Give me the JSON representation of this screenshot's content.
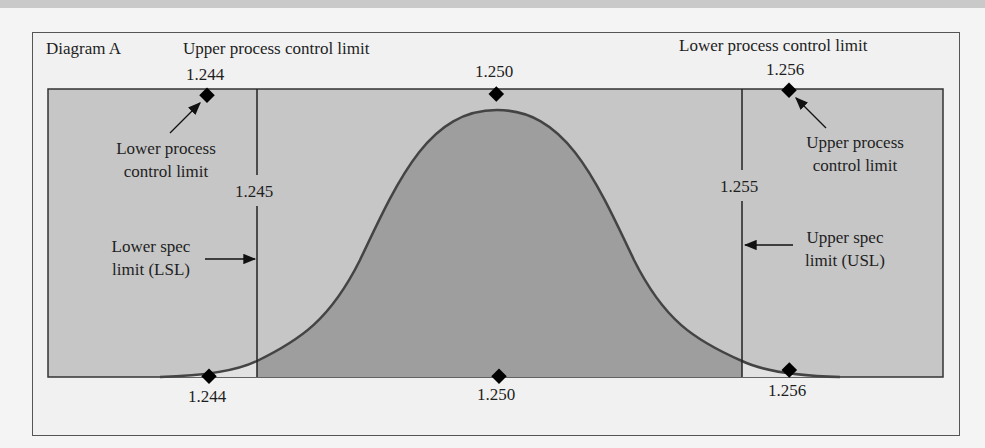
{
  "diagram": {
    "title": "Diagram A",
    "header_left": "Upper process control limit",
    "header_right": "Lower process control limit",
    "top_markers": [
      {
        "value": "1.244"
      },
      {
        "value": "1.250"
      },
      {
        "value": "1.256"
      }
    ],
    "bottom_markers": [
      {
        "value": "1.244"
      },
      {
        "value": "1.250"
      },
      {
        "value": "1.256"
      }
    ],
    "annotations": {
      "lower_pcl_line1": "Lower process",
      "lower_pcl_line2": "control limit",
      "upper_pcl_line1": "Upper process",
      "upper_pcl_line2": "control limit",
      "lsl_value": "1.245",
      "usl_value": "1.255",
      "lsl_line1": "Lower spec",
      "lsl_line2": "limit (LSL)",
      "usl_line1": "Upper spec",
      "usl_line2": "limit (USL)"
    },
    "colors": {
      "box_fill": "#c6c6c6",
      "curve_fill": "#9e9e9e",
      "tail_fill": "#e2e2e2",
      "line": "#333333",
      "marker": "#000000"
    }
  }
}
